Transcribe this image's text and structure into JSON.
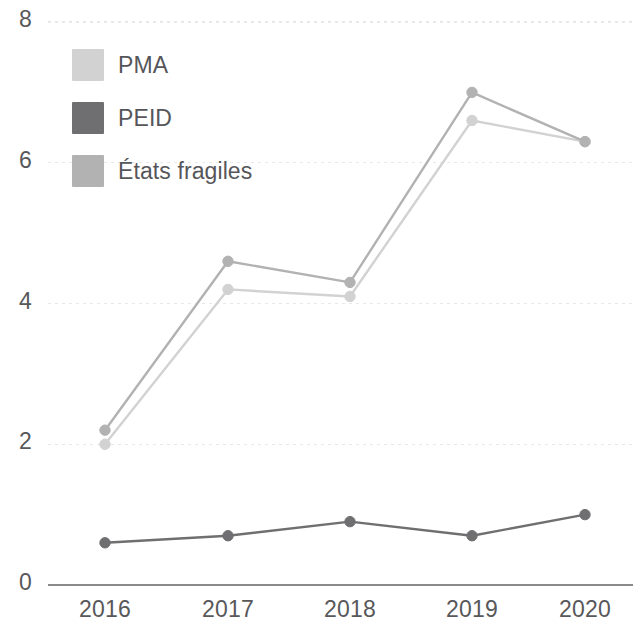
{
  "chart_data": {
    "type": "line",
    "title": "",
    "xlabel": "",
    "ylabel": "",
    "categories": [
      "2016",
      "2017",
      "2018",
      "2019",
      "2020"
    ],
    "x_tick_labels": [
      "2016",
      "2017",
      "2018",
      "2019",
      "2020"
    ],
    "y_tick_labels": [
      "0",
      "2",
      "4",
      "6",
      "8"
    ],
    "y_ticks": [
      0,
      2,
      4,
      6,
      8
    ],
    "ylim": [
      0,
      8
    ],
    "grid": true,
    "grid_axis": "y",
    "legend_position": "top-left",
    "series": [
      {
        "name": "PMA",
        "color": "#d2d2d2",
        "values": [
          2.0,
          4.2,
          4.1,
          6.6,
          6.3
        ]
      },
      {
        "name": "PEID",
        "color": "#6f6f71",
        "values": [
          0.6,
          0.7,
          0.9,
          0.7,
          1.0
        ]
      },
      {
        "name": "États fragiles",
        "color": "#b2b2b2",
        "values": [
          2.2,
          4.6,
          4.3,
          7.0,
          6.3
        ]
      }
    ],
    "colors": {
      "axis_line": "#8a8a8c",
      "grid_line": "#e8e8ea",
      "tick_text": "#58585a",
      "legend_text": "#56565a",
      "background": "#ffffff"
    }
  }
}
